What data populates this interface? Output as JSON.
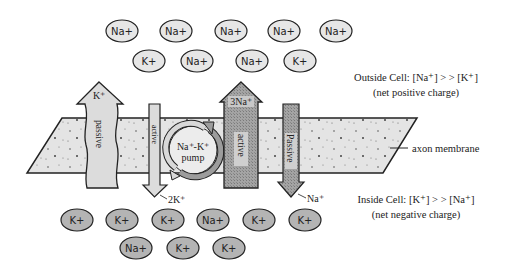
{
  "diagram": {
    "outside_ions": {
      "row1": [
        "Na+",
        "Na+",
        "Na+",
        "Na+",
        "Na+"
      ],
      "row2": [
        "K+",
        "Na+",
        "Na+",
        "K+"
      ]
    },
    "inside_ions": {
      "row1": [
        "K+",
        "K+",
        "K+",
        "Na+",
        "K+",
        "K+"
      ],
      "row2": [
        "Na+",
        "K+",
        "K+"
      ]
    },
    "labels": {
      "outside_line1": "Outside Cell: [Na⁺] > > [K⁺]",
      "outside_line2": "(net positive charge)",
      "inside_line1": "Inside Cell: [K⁺] > > [Na⁺]",
      "inside_line2": "(net negative charge)",
      "membrane": "axon membrane"
    },
    "arrows": {
      "k_passive": {
        "ion": "K⁺",
        "label": "passive",
        "direction": "out"
      },
      "k_active": {
        "ion": "2K⁺",
        "label": "active",
        "direction": "in"
      },
      "na_active": {
        "ion": "3Na⁺",
        "label": "active",
        "direction": "out"
      },
      "na_passive": {
        "ion": "Na⁺",
        "label": "Passive",
        "direction": "in"
      }
    },
    "pump": {
      "line1": "Na⁺-K⁺",
      "line2": "pump"
    },
    "colors": {
      "membrane_fill": "#e2e2e2",
      "outside_ion_fill": "#e6e6e6",
      "inside_ion_fill": "#b4b4b4",
      "light_arrow_fill": "#dcdcdc",
      "dark_arrow_fill": "#9a9a9a",
      "stroke": "#222222"
    }
  }
}
